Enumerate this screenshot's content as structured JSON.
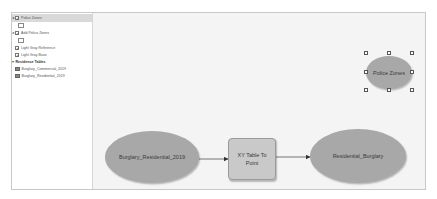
{
  "sidebar": {
    "items": [
      {
        "label": "Police Zones",
        "type": "layer",
        "checked": true,
        "selected": true
      },
      {
        "label": "",
        "type": "symbol-placeholder"
      },
      {
        "label": "Add Police Zones",
        "type": "layer",
        "checked": true,
        "selected": false
      },
      {
        "label": "",
        "type": "symbol-placeholder"
      },
      {
        "label": "Light Gray Reference",
        "type": "basemap",
        "checked": true
      },
      {
        "label": "Light Gray Base",
        "type": "basemap",
        "checked": true
      },
      {
        "label": "Residence Tables",
        "type": "group-header",
        "expanded": true
      },
      {
        "label": "Burglary_Commercial_2019",
        "type": "table"
      },
      {
        "label": "Burglary_Residential_2019",
        "type": "table"
      }
    ]
  },
  "canvas": {
    "nodes": {
      "police_zones": {
        "label": "Police Zones",
        "shape": "ellipse",
        "selected": true
      },
      "input": {
        "label": "Burglary_Residential_2019",
        "shape": "ellipse"
      },
      "tool": {
        "label": "XY Table To Point",
        "shape": "rounded-rect"
      },
      "output": {
        "label": "Residential_Burglary",
        "shape": "ellipse"
      }
    },
    "connections": [
      {
        "from": "Burglary_Residential_2019",
        "to": "XY Table To Point"
      },
      {
        "from": "XY Table To Point",
        "to": "Residential_Burglary"
      }
    ]
  },
  "colors": {
    "node_fill": "#a8a8a8",
    "tool_fill": "#c9c9c9",
    "canvas_bg": "#f4f4f4",
    "selected_row": "#d9d9d9"
  }
}
